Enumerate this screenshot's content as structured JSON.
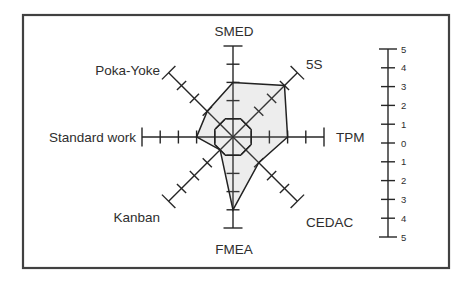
{
  "figure": {
    "background": "#ffffff",
    "frame_color": "#414141"
  },
  "chart_data": {
    "type": "radar",
    "title": "",
    "axes": [
      "SMED",
      "5S",
      "TPM",
      "CEDAC",
      "FMEA",
      "Kanban",
      "Standard work",
      "Poka-Yoke"
    ],
    "axis_max": 5,
    "axis_ticks": [
      1,
      2,
      3,
      4,
      5
    ],
    "series": [
      {
        "name": "assessment",
        "values": [
          3,
          4,
          3,
          2,
          4,
          1,
          2,
          2
        ],
        "stroke": "#222222",
        "fill": "#8c8c8c",
        "fill_opacity": 0.16
      }
    ],
    "reference_octagon": {
      "crosses_each_axis_at": 1,
      "stroke": "#222222"
    },
    "scale_bar": {
      "labels_top_to_bottom": [
        "5",
        "4",
        "3",
        "2",
        "1",
        "0",
        "1",
        "2",
        "3",
        "4",
        "5"
      ],
      "range_top": 5,
      "range_bottom": -5
    },
    "line_color": "#262626",
    "label_color": "#2e2e2e",
    "grid": false,
    "legend": null
  }
}
